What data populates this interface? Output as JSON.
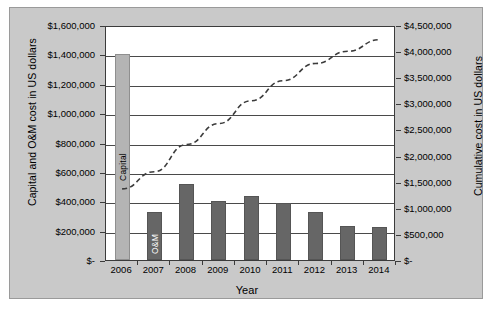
{
  "chart_data": {
    "type": "bar",
    "title": "",
    "xlabel": "Year",
    "ylabel": "Capital and O&M cost in US dollars",
    "ylabel_right": "Cumulative cost in US dollars",
    "categories": [
      "2006",
      "2007",
      "2008",
      "2009",
      "2010",
      "2011",
      "2012",
      "2013",
      "2014"
    ],
    "ylim": [
      0,
      1600000
    ],
    "ylim_right": [
      0,
      4500000
    ],
    "grid": true,
    "legend_position": "in-bar labels",
    "series": [
      {
        "name": "Capital",
        "type": "bar",
        "color": "#b4b4b4",
        "axis": "left",
        "values": [
          1400000,
          0,
          0,
          0,
          0,
          0,
          0,
          0,
          0
        ]
      },
      {
        "name": "O&M",
        "type": "bar",
        "color": "#666666",
        "axis": "left",
        "values": [
          0,
          330000,
          520000,
          400000,
          437000,
          385000,
          330000,
          232000,
          225000
        ]
      },
      {
        "name": "Cumulative cost",
        "type": "line",
        "style": "dashed",
        "color": "#3b3b3b",
        "axis": "right",
        "values": [
          1400000,
          1730000,
          2250000,
          2650000,
          3087000,
          3472000,
          3802000,
          4034000,
          4259000
        ]
      }
    ],
    "yticks_left": [
      "$1,600,000",
      "$1,400,000",
      "$1,200,000",
      "$1,000,000",
      "$800,000",
      "$600,000",
      "$400,000",
      "$200,000",
      "$-"
    ],
    "yticks_right": [
      "$4,500,000",
      "$4,000,000",
      "$3,500,000",
      "$3,000,000",
      "$2,500,000",
      "$2,000,000",
      "$1,500,000",
      "$1,000,000",
      "$500,000",
      "$-"
    ],
    "bar_annotations": [
      {
        "category": "2006",
        "text": "Capital"
      },
      {
        "category": "2007",
        "text": "O&M"
      }
    ]
  },
  "axes": {
    "left_title": "Capital and O&M cost in US dollars",
    "right_title": "Cumulative cost in US dollars",
    "x_title": "Year"
  }
}
